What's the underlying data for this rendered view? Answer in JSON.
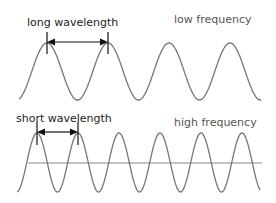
{
  "top": {
    "wavelength_label": "long wavelength",
    "frequency_label": "low frequency",
    "peaks_x": [
      47,
      108,
      169,
      231
    ],
    "period_px": 61
  },
  "bottom": {
    "wavelength_label": "short wavelength",
    "frequency_label": "high frequency",
    "peaks_x": [
      37,
      78,
      119,
      160,
      200,
      241
    ],
    "period_px": 41
  },
  "colors": {
    "wave": "#777777",
    "axis": "#888888",
    "arrow": "#111111"
  }
}
